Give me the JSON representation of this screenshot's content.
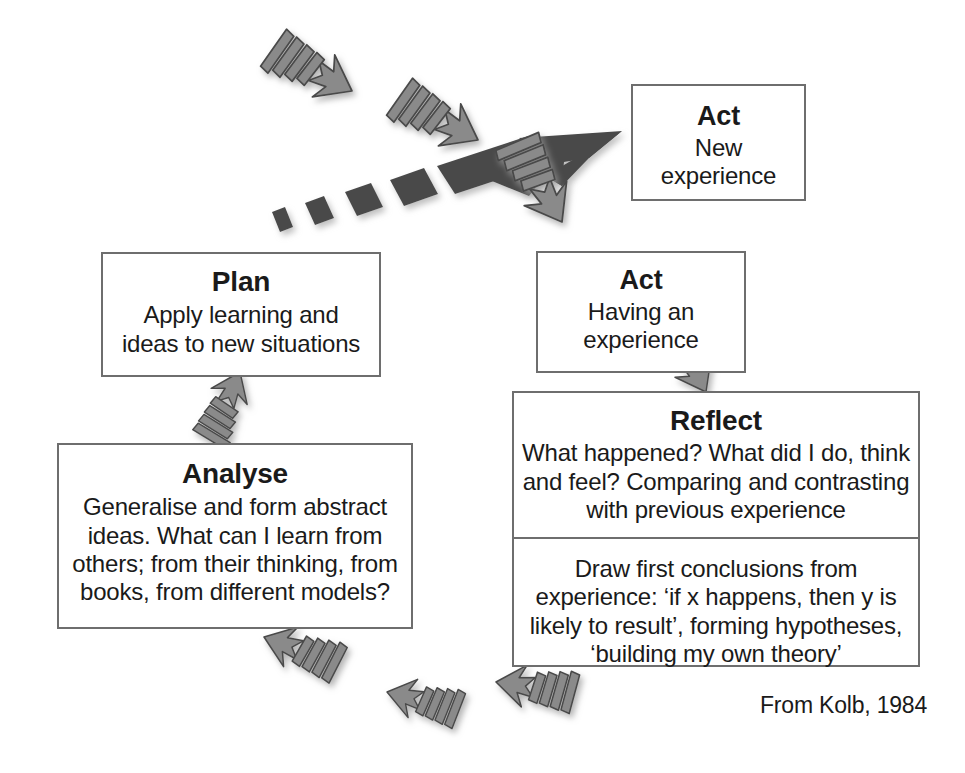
{
  "diagram": {
    "attribution": "From Kolb, 1984",
    "colors": {
      "box_border": "#6e6e6e",
      "text": "#1a1a1a",
      "arrow_gray": "#8a8a8a",
      "arrow_gray_stroke": "#4a4a4a",
      "arrow_dark": "#4a4a4a",
      "background": "#ffffff"
    },
    "nodes": [
      {
        "id": "act-new",
        "title": "Act",
        "body": "New\nexperience"
      },
      {
        "id": "act-having",
        "title": "Act",
        "body": "Having an\nexperience"
      },
      {
        "id": "plan",
        "title": "Plan",
        "body": "Apply learning and\nideas to new situations"
      },
      {
        "id": "analyse",
        "title": "Analyse",
        "body": "Generalise and form abstract\nideas. What can I learn from\nothers; from their thinking, from\nbooks, from different models?"
      },
      {
        "id": "reflect",
        "title": "Reflect",
        "body": "What happened? What did I do, think\nand feel? Comparing and contrasting\nwith previous experience"
      },
      {
        "id": "conclusions",
        "title": "",
        "body": "Draw first conclusions from\nexperience: ‘if x happens, then y is\nlikely to result’, forming hypotheses,\n‘building my own theory’"
      }
    ],
    "connectors": [
      {
        "id": "act-having-to-reflect",
        "from": "act-having",
        "to": "reflect",
        "direction": "down-right",
        "style": "gray-striped"
      },
      {
        "id": "conclusions-to-analyse",
        "from": "conclusions",
        "to": "analyse",
        "direction": "left",
        "style": "gray-striped"
      },
      {
        "id": "analyse-to-plan",
        "from": "analyse",
        "to": "plan",
        "direction": "up",
        "style": "gray-striped"
      },
      {
        "id": "plan-to-act-new",
        "from": "plan",
        "to": "act-new",
        "direction": "up-right",
        "style": "dark-dashed-spiral"
      }
    ]
  }
}
